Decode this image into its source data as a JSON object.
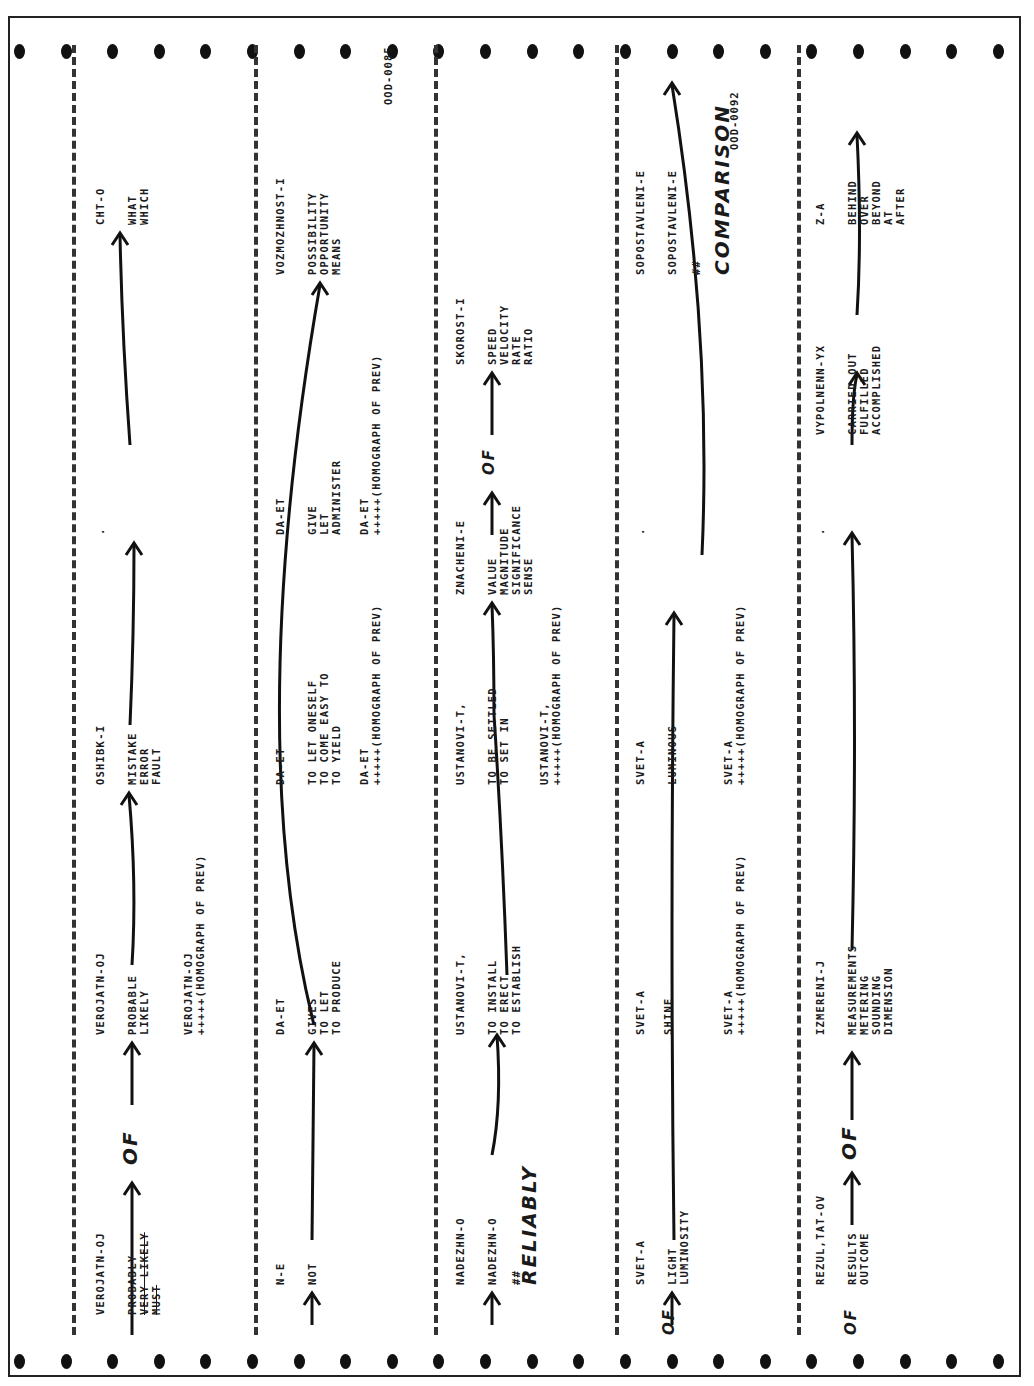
{
  "document": {
    "codes": [
      "OOD-0085",
      "OOD-0092"
    ],
    "rows": [
      {
        "words": [
          {
            "head": "VEROJATN-OJ",
            "lines": "PROBABLY\nVERY LIKELY\nMUST"
          },
          {
            "head": "VEROJATN-OJ",
            "lines": "PROBABLE\nLIKELY",
            "homo": "VEROJATN-OJ\n+++++(HOMOGRAPH OF PREV)"
          },
          {
            "head": "OSHIBK-I",
            "lines": "MISTAKE\nERROR\nFAULT"
          },
          {
            "head": ".",
            "lines": "."
          },
          {
            "head": "CHT-O",
            "lines": "WHAT\nWHICH"
          }
        ],
        "annotations": [
          "OF"
        ]
      },
      {
        "words": [
          {
            "head": "N-E",
            "lines": "NOT"
          },
          {
            "head": "DA-ET",
            "lines": "GIVES\nTO LET\nTO PRODUCE"
          },
          {
            "head": "DA-ET",
            "lines": "TO LET ONESELF\nTO COME EASY TO\nTO YIELD",
            "homo": "DA-ET\n+++++(HOMOGRAPH OF PREV)"
          },
          {
            "head": "DA-ET",
            "lines": "GIVE\nLET\nADMINISTER",
            "homo": "DA-ET\n+++++(HOMOGRAPH OF PREV)"
          },
          {
            "head": "VOZMOZHNOST-I",
            "lines": "POSSIBILITY\nOPPORTUNITY\nMEANS"
          }
        ],
        "code": "OOD-0085"
      },
      {
        "words": [
          {
            "head": "NADEZHN-O",
            "lines": "NADEZHN-O\n\n##"
          },
          {
            "head": "USTANOVI-T,",
            "lines": "TO INSTALL\nTO ERECT\nTO ESTABLISH"
          },
          {
            "head": "USTANOVI-T,",
            "lines": "TO BE SETTLED\nTO SET IN",
            "homo": "USTANOVI-T,\n+++++(HOMOGRAPH OF PREV)"
          },
          {
            "head": "ZNACHENI-E",
            "lines": "VALUE\nMAGNITUDE\nSIGNIFICANCE\nSENSE"
          },
          {
            "head": "SKOROST-I",
            "lines": "SPEED\nVELOCITY\nRATE\nRATIO"
          }
        ],
        "annotations": [
          "RELIABLY",
          "OF"
        ]
      },
      {
        "words": [
          {
            "head": "SVET-A",
            "lines": "LIGHT\nLUMINOSITY"
          },
          {
            "head": "SVET-A",
            "lines": "SHINE",
            "homo": "SVET-A\n+++++(HOMOGRAPH OF PREV)"
          },
          {
            "head": "SVET-A",
            "lines": "LUMINOUS",
            "homo": "SVET-A\n+++++(HOMOGRAPH OF PREV)"
          },
          {
            "head": ".",
            "lines": "."
          },
          {
            "head": "SOPOSTAVLENI-E",
            "lines": "SOPOSTAVLENI-E\n\n##"
          }
        ],
        "annotations": [
          "OF",
          "COMPARISON"
        ],
        "code": "OOD-0092"
      },
      {
        "words": [
          {
            "head": "REZUL,TAT-OV",
            "lines": "RESULTS\nOUTCOME"
          },
          {
            "head": "IZMERENI-J",
            "lines": "MEASUREMENTS\nMETERING\nSOUNDING\nDIMENSION"
          },
          {
            "head": ".",
            "lines": "."
          },
          {
            "head": "VYPOLNENN-YX",
            "lines": "CARRIED OUT\nFULFILLED\nACCOMPLISHED"
          },
          {
            "head": "Z-A",
            "lines": "BEHIND\nOVER\nBEYOND\nAT\nAFTER"
          }
        ],
        "annotations": [
          "OF",
          "OF"
        ]
      }
    ]
  }
}
